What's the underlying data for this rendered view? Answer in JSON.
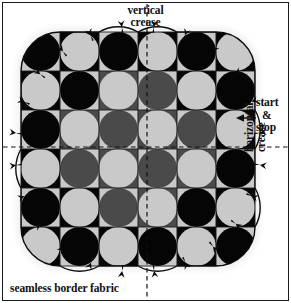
{
  "diagram": {
    "labels": {
      "vertical_crease_line1": "vertical",
      "vertical_crease_line2": "crease",
      "start": "start",
      "ampersand": "&",
      "stop": "stop",
      "horizontal_crease_line1": "horizontal",
      "horizontal_crease_line2": "crease",
      "seamless_border_fabric": "seamless border fabric"
    },
    "colors": {
      "ink": "#111111",
      "black_patch": "#050505",
      "dark_gray_patch": "#4a4a4a",
      "light_gray_patch": "#c9c9c9",
      "paper": "#ffffff",
      "halo": "#f2f2f2"
    },
    "geometry": {
      "grid_rows": 6,
      "grid_cols": 6,
      "cell_size_px": 39,
      "grid_origin_x_px": 21,
      "grid_origin_y_px": 32,
      "vertical_crease_x_px": 147,
      "horizontal_crease_y_px": 147,
      "arrow_tip_x_px": 238,
      "arrow_y_px": 118,
      "pin_marker_count": 24
    },
    "creases": [
      {
        "name": "vertical-crease",
        "orientation": "vertical",
        "style": "dashed"
      },
      {
        "name": "horizontal-crease",
        "orientation": "horizontal",
        "style": "dashed"
      }
    ]
  }
}
